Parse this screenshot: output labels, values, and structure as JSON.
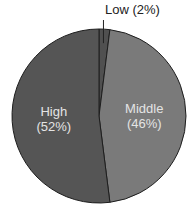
{
  "chart_data": {
    "type": "pie",
    "title": "",
    "categories": [
      "Low",
      "Middle",
      "High"
    ],
    "values": [
      2,
      46,
      52
    ],
    "unit": "%",
    "start_angle_deg": 0,
    "direction": "clockwise",
    "colors": {
      "Low": "#505050",
      "Middle": "#7a7a7a",
      "High": "#555555"
    },
    "labels": {
      "Low": {
        "name": "Low",
        "pct": "(2%)",
        "full": "Low (2%)",
        "position": "outside-top"
      },
      "Middle": {
        "name": "Middle",
        "pct": "(46%)",
        "position": "inside"
      },
      "High": {
        "name": "High",
        "pct": "(52%)",
        "position": "inside"
      }
    },
    "legend": null,
    "grid": false
  },
  "geometry": {
    "cx": 99,
    "cy": 116,
    "r": 87
  },
  "style": {
    "outline": "#1e1e1e",
    "label_inside": "#e4e4e4",
    "label_outside": "#222222"
  }
}
